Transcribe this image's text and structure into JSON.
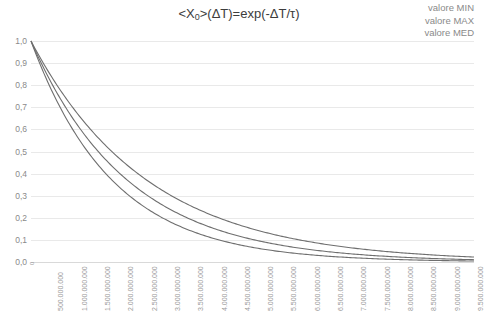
{
  "chart_data": {
    "type": "line",
    "title": "<X0>(ΔT)=exp(-ΔT/τ)",
    "title_main_pre": "<X",
    "title_sub": "0",
    "title_main_post": ">(ΔT)=exp(-ΔT/τ)",
    "xlabel": "",
    "ylabel": "",
    "xlim": [
      0,
      9500000000
    ],
    "ylim": [
      0,
      1.0
    ],
    "grid": true,
    "legend_position": "top-right",
    "legend": [
      "valore MIN",
      "valore MAX",
      "valore MED"
    ],
    "yticks": [
      "0,0",
      "0,1",
      "0,2",
      "0,3",
      "0,4",
      "0,5",
      "0,6",
      "0,7",
      "0,8",
      "0,9",
      "1,0"
    ],
    "ytick_values": [
      0,
      0.1,
      0.2,
      0.3,
      0.4,
      0.5,
      0.6,
      0.7,
      0.8,
      0.9,
      1.0
    ],
    "origin_label": "0",
    "xticks": [
      "500.000.000",
      "1.000.000.000",
      "1.500.000.000",
      "2.000.000.000",
      "2.500.000.000",
      "3.000.000.000",
      "3.500.000.000",
      "4.000.000.000",
      "4.500.000.000",
      "5.000.000.000",
      "5.500.000.000",
      "6.000.000.000",
      "6.500.000.000",
      "7.000.000.000",
      "7.500.000.000",
      "8.000.000.000",
      "8.500.000.000",
      "9.000.000.000",
      "9.500.000.000"
    ],
    "xtick_values": [
      500000000,
      1000000000,
      1500000000,
      2000000000,
      2500000000,
      3000000000,
      3500000000,
      4000000000,
      4500000000,
      5000000000,
      5500000000,
      6000000000,
      6500000000,
      7000000000,
      7500000000,
      8000000000,
      8500000000,
      9000000000,
      9500000000
    ],
    "series": [
      {
        "name": "valore MIN",
        "tau": 1750000000,
        "x": [
          0,
          500000000,
          1000000000,
          1500000000,
          2000000000,
          2500000000,
          3000000000,
          3500000000,
          4000000000,
          4500000000,
          5000000000,
          5500000000,
          6000000000,
          6500000000,
          7000000000,
          7500000000,
          8000000000,
          8500000000,
          9000000000,
          9500000000
        ],
        "values": [
          1.0,
          0.751,
          0.565,
          0.424,
          0.319,
          0.24,
          0.18,
          0.135,
          0.102,
          0.076,
          0.058,
          0.043,
          0.032,
          0.024,
          0.018,
          0.014,
          0.01,
          0.008,
          0.006,
          0.005
        ]
      },
      {
        "name": "valore MAX",
        "tau": 2500000000,
        "x": [
          0,
          500000000,
          1000000000,
          1500000000,
          2000000000,
          2500000000,
          3000000000,
          3500000000,
          4000000000,
          4500000000,
          5000000000,
          5500000000,
          6000000000,
          6500000000,
          7000000000,
          7500000000,
          8000000000,
          8500000000,
          9000000000,
          9500000000
        ],
        "values": [
          1.0,
          0.819,
          0.67,
          0.549,
          0.449,
          0.368,
          0.301,
          0.247,
          0.202,
          0.165,
          0.135,
          0.111,
          0.091,
          0.074,
          0.061,
          0.05,
          0.041,
          0.033,
          0.027,
          0.022
        ]
      },
      {
        "name": "valore MED",
        "tau": 2080000000,
        "x": [
          0,
          500000000,
          1000000000,
          1500000000,
          2000000000,
          2500000000,
          3000000000,
          3500000000,
          4000000000,
          4500000000,
          5000000000,
          5500000000,
          6000000000,
          6500000000,
          7000000000,
          7500000000,
          8000000000,
          8500000000,
          9000000000,
          9500000000
        ],
        "values": [
          1.0,
          0.786,
          0.618,
          0.486,
          0.382,
          0.3,
          0.236,
          0.186,
          0.146,
          0.115,
          0.09,
          0.071,
          0.056,
          0.044,
          0.034,
          0.027,
          0.021,
          0.017,
          0.013,
          0.01
        ]
      }
    ],
    "colors": {
      "curve": "#6e6e6e",
      "grid": "#e9e9e9",
      "text": "#8a8a8a",
      "title": "#3c3c3c",
      "background": "#ffffff"
    }
  }
}
